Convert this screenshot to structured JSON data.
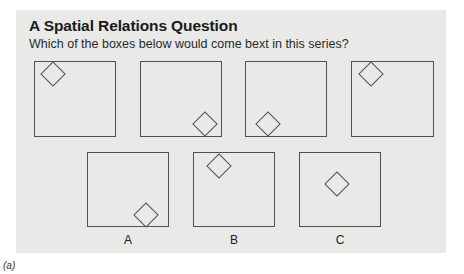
{
  "figure": {
    "title": "A Spatial Relations Question",
    "question": "Which of the boxes below would come bext in this series?",
    "caption": "(a)",
    "colors": {
      "panel": "#e9e9e8",
      "stroke": "#505050",
      "text": "#1a1a1a"
    }
  },
  "series": [
    {
      "index": 1,
      "diamond_position": "top-left"
    },
    {
      "index": 2,
      "diamond_position": "bottom-right"
    },
    {
      "index": 3,
      "diamond_position": "bottom-left"
    },
    {
      "index": 4,
      "diamond_position": "top-left"
    }
  ],
  "options": [
    {
      "label": "A",
      "diamond_position": "bottom-right"
    },
    {
      "label": "B",
      "diamond_position": "top-left"
    },
    {
      "label": "C",
      "diamond_position": "center"
    }
  ]
}
